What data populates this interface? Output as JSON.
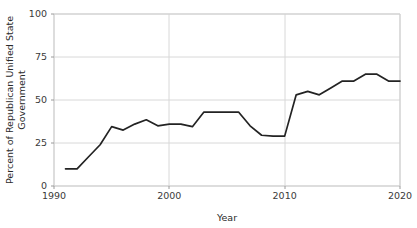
{
  "chart_data": {
    "type": "line",
    "title": "",
    "xlabel": "Year",
    "ylabel": "Percent of Republican Unified State Government",
    "ylabel_line1": "Percent of Republican Unified State",
    "ylabel_line2": "Government",
    "xlim": [
      1990,
      2020
    ],
    "ylim": [
      0,
      100
    ],
    "xticks": [
      1990,
      2000,
      2010,
      2020
    ],
    "xtick_labels": [
      "1990",
      "2000",
      "2010",
      "2020"
    ],
    "yticks": [
      0,
      25,
      50,
      75,
      100
    ],
    "ytick_labels": [
      "0",
      "25",
      "50",
      "75",
      "100"
    ],
    "grid": true,
    "grid_axis": "both",
    "legend": false,
    "line_color": "#232323",
    "grid_color": "#d8d8d8",
    "spine_color": "#cfcfcf",
    "background_color": "#ffffff",
    "x": [
      1991,
      1992,
      1993,
      1994,
      1995,
      1996,
      1997,
      1998,
      1999,
      2000,
      2001,
      2002,
      2003,
      2004,
      2005,
      2006,
      2007,
      2008,
      2009,
      2010,
      2011,
      2012,
      2013,
      2014,
      2015,
      2016,
      2017,
      2018,
      2019,
      2020
    ],
    "values": [
      10,
      10,
      17,
      24,
      34.5,
      32.5,
      36,
      38.5,
      35,
      36,
      36,
      34.5,
      43,
      43,
      43,
      43,
      35,
      29.5,
      29,
      29,
      53,
      55,
      53,
      57,
      61,
      61,
      65,
      65,
      61,
      61
    ],
    "series": [
      {
        "name": "Percent of Republican Unified State Government",
        "values": [
          10,
          10,
          17,
          24,
          34.5,
          32.5,
          36,
          38.5,
          35,
          36,
          36,
          34.5,
          43,
          43,
          43,
          43,
          35,
          29.5,
          29,
          29,
          53,
          55,
          53,
          57,
          61,
          61,
          65,
          65,
          61,
          61
        ]
      }
    ]
  }
}
